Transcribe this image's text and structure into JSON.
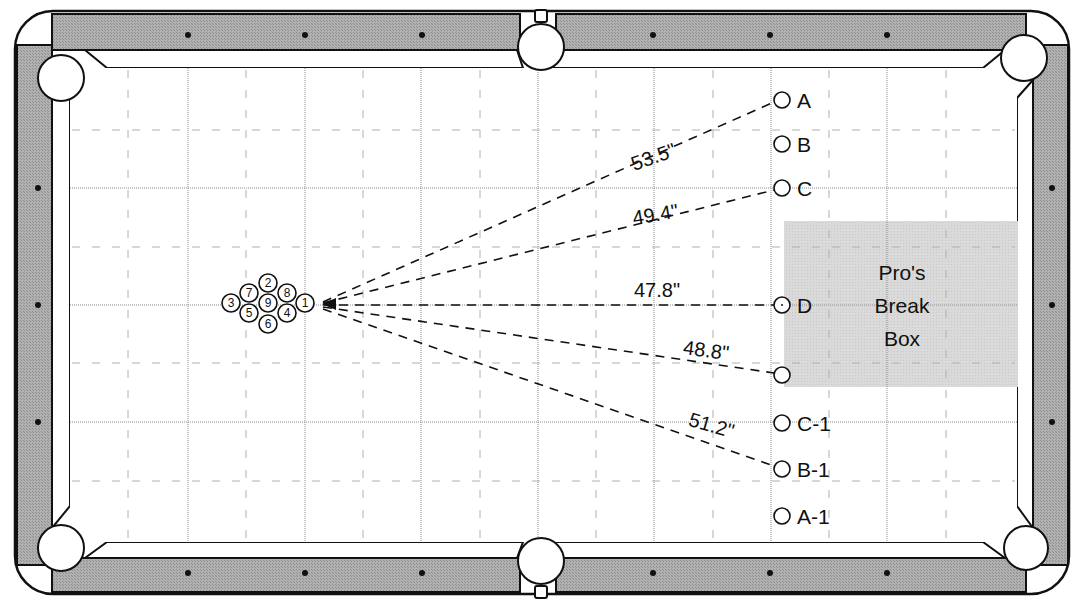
{
  "diagram": {
    "rack": {
      "balls": [
        {
          "num": "1",
          "x": 305,
          "y": 303
        },
        {
          "num": "2",
          "x": 268,
          "y": 283
        },
        {
          "num": "3",
          "x": 231,
          "y": 303
        },
        {
          "num": "4",
          "x": 287,
          "y": 313
        },
        {
          "num": "5",
          "x": 249,
          "y": 313
        },
        {
          "num": "6",
          "x": 268,
          "y": 324
        },
        {
          "num": "7",
          "x": 249,
          "y": 293
        },
        {
          "num": "8",
          "x": 287,
          "y": 293
        },
        {
          "num": "9",
          "x": 268,
          "y": 304
        }
      ]
    },
    "positions": [
      {
        "label": "A",
        "x": 782,
        "y": 100
      },
      {
        "label": "B",
        "x": 782,
        "y": 144
      },
      {
        "label": "C",
        "x": 782,
        "y": 188
      },
      {
        "label": "D",
        "x": 782,
        "y": 305
      },
      {
        "label": "",
        "x": 782,
        "y": 375
      },
      {
        "label": "C-1",
        "x": 782,
        "y": 423
      },
      {
        "label": "B-1",
        "x": 782,
        "y": 469
      },
      {
        "label": "A-1",
        "x": 782,
        "y": 516
      }
    ],
    "distances": [
      {
        "label": "53.5\"",
        "to": "A",
        "x": 663,
        "y": 138,
        "angle": -19.5
      },
      {
        "label": "49.4\"",
        "to": "C",
        "x": 663,
        "y": 210,
        "angle": -9.5
      },
      {
        "label": "47.8\"",
        "to": "D",
        "x": 663,
        "y": 295,
        "angle": 0
      },
      {
        "label": "48.8\"",
        "to": "lower-break",
        "x": 717,
        "y": 355,
        "angle": 7.5
      },
      {
        "label": "51.2\"",
        "to": "B-1",
        "x": 718,
        "y": 432,
        "angle": 16
      }
    ],
    "break_box": {
      "line1": "Pro's",
      "line2": "Break",
      "line3": "Box",
      "x": 784,
      "y": 221,
      "width": 234,
      "height": 166
    },
    "cue_marker": {
      "x": 331,
      "y": 304
    },
    "colors": {
      "rail": "#a9a9a9",
      "break_box": "#d6d6d6",
      "line": "#111111",
      "grid": "#9a9a9a",
      "felt": "#ffffff"
    }
  }
}
